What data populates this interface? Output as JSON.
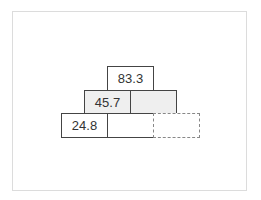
{
  "puzzle": {
    "type": "addition-pyramid",
    "rows": [
      {
        "cells": [
          {
            "value": "83.3",
            "shaded": false
          }
        ]
      },
      {
        "cells": [
          {
            "value": "45.7",
            "shaded": true
          },
          {
            "value": "",
            "shaded": true
          }
        ]
      },
      {
        "cells": [
          {
            "value": "24.8",
            "shaded": false
          },
          {
            "value": "",
            "shaded": false
          },
          {
            "value": "",
            "shaded": false,
            "selected": true
          }
        ]
      }
    ]
  }
}
